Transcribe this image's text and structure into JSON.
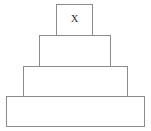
{
  "figure": {
    "background_color": "#ffffff",
    "stroke_color": "#8b8b8b",
    "label_color": "#2b2b2b",
    "tier_count": "4",
    "tiers": [
      {
        "id": "tier-1",
        "position": "top",
        "label": "X",
        "has_label": "true"
      },
      {
        "id": "tier-2",
        "position": "second",
        "label": "",
        "has_label": "false"
      },
      {
        "id": "tier-3",
        "position": "third",
        "label": "",
        "has_label": "false"
      },
      {
        "id": "tier-4",
        "position": "bottom",
        "label": "",
        "has_label": "false"
      }
    ]
  }
}
